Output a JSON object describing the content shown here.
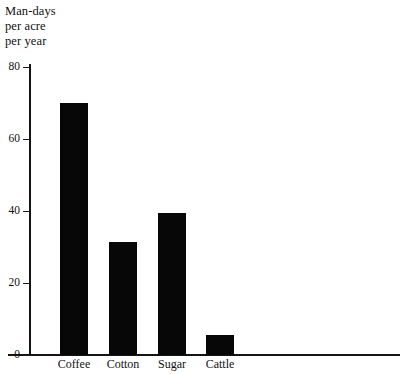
{
  "chart_data": {
    "type": "bar",
    "title": "Man-days per acre per year",
    "title_lines": [
      "Man-days",
      "per acre",
      "per year"
    ],
    "xlabel": "",
    "ylabel": "Man-days per acre per year",
    "categories": [
      "Coffee",
      "Cotton",
      "Sugar",
      "Cattle"
    ],
    "values": [
      70,
      31.5,
      39.5,
      5.5
    ],
    "ylim": [
      0,
      80
    ],
    "yticks": [
      0,
      20,
      40,
      60,
      80
    ],
    "ytick_labels": [
      "0",
      "20",
      "40",
      "60",
      "80"
    ],
    "grid": false,
    "legend": null,
    "bar_color": "#070707",
    "axis_color": "#141414",
    "background": "#ffffff"
  },
  "axis_caption": {
    "line1": "Man-days",
    "line2": "per acre",
    "line3": "per year"
  }
}
